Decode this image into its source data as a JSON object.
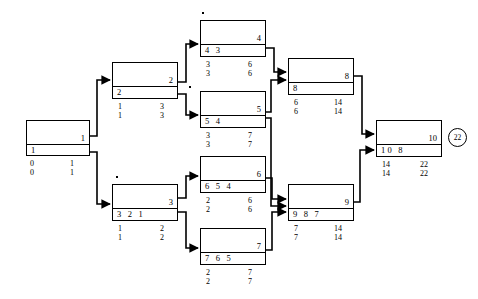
{
  "diagram": {
    "terminal": {
      "label": "22"
    },
    "nodes": [
      {
        "id": "1",
        "predecessors": "1",
        "est": "0",
        "eft": "1",
        "lst": "0",
        "lft": "1"
      },
      {
        "id": "2",
        "predecessors": "2",
        "est": "1",
        "eft": "3",
        "lst": "1",
        "lft": "3"
      },
      {
        "id": "3",
        "predecessors": "3 2 1",
        "est": "1",
        "eft": "2",
        "lst": "1",
        "lft": "2"
      },
      {
        "id": "4",
        "predecessors": "4 3",
        "est": "3",
        "eft": "6",
        "lst": "3",
        "lft": "6"
      },
      {
        "id": "5",
        "predecessors": "5 4",
        "est": "3",
        "eft": "7",
        "lst": "3",
        "lft": "7"
      },
      {
        "id": "6",
        "predecessors": "6 5 4",
        "est": "2",
        "eft": "6",
        "lst": "2",
        "lft": "6"
      },
      {
        "id": "7",
        "predecessors": "7 6 5",
        "est": "2",
        "eft": "7",
        "lst": "2",
        "lft": "7"
      },
      {
        "id": "8",
        "predecessors": "8",
        "est": "6",
        "eft": "14",
        "lst": "6",
        "lft": "14"
      },
      {
        "id": "9",
        "predecessors": "9 8 7",
        "est": "7",
        "eft": "14",
        "lst": "7",
        "lft": "14"
      },
      {
        "id": "10",
        "predecessors": "10 8",
        "est": "14",
        "eft": "22",
        "lst": "14",
        "lft": "22"
      }
    ]
  }
}
